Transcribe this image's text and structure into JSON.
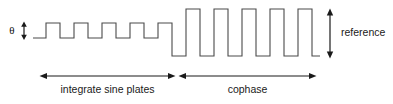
{
  "figure": {
    "type": "timing-diagram",
    "background_color": "#ffffff",
    "wave_color": "#4a4a4a",
    "annotation_color": "#1a1a1a",
    "labels": {
      "theta": "θ",
      "reference": "reference",
      "phase_left": "integrate sine plates",
      "phase_right": "cophase"
    },
    "annotations": {
      "theta_arrow": {
        "name": "theta-amplitude-arrow",
        "orientation": "vertical",
        "double_headed": true,
        "x": 24,
        "y_top": 22.5,
        "y_bottom": 39
      },
      "reference_arrow": {
        "name": "reference-amplitude-arrow",
        "orientation": "vertical",
        "double_headed": true,
        "x": 330,
        "y_top": 10,
        "y_bottom": 57
      },
      "left_span_arrow": {
        "name": "integrate-sine-plates-span-arrow",
        "orientation": "horizontal",
        "double_headed": true,
        "y": 76,
        "x_start": 41,
        "x_end": 174
      },
      "right_span_arrow": {
        "name": "cophase-span-arrow",
        "orientation": "horizontal",
        "double_headed": true,
        "y": 76,
        "x_start": 180,
        "x_end": 315
      }
    },
    "waveform": {
      "description": "Square wave: five small-amplitude pulses on the left (integrate sine plates), then five large-amplitude pulses on the right (cophase).",
      "left_section": {
        "pulse_count": 5,
        "baseline_y": 38,
        "peak_y": 23,
        "amplitude_label": "θ"
      },
      "right_section": {
        "pulse_count": 5,
        "baseline_y": 56,
        "peak_y": 9,
        "amplitude_label": "reference"
      },
      "path": "M 33,38 L 46,38 L 46,23 L 60,23 L 60,38 L 74,38 L 74,23 L 88,23 L 88,38 L 102,38 L 102,23 L 116,23 L 116,38 L 130,38 L 130,23 L 144,23 L 144,38 L 158,38 L 158,23 L 172,23 L 172,56 L 186,56 L 186,9 L 200,9 L 200,56 L 214,56 L 214,9 L 228,9 L 228,56 L 242,56 L 242,9 L 256,9 L 256,56 L 270,56 L 270,9 L 284,9 L 284,56 L 298,56 L 298,9 L 312,9 L 312,56 L 320,56"
    }
  }
}
